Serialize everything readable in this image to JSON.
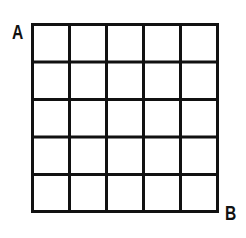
{
  "labels": {
    "start": "A",
    "end": "B"
  },
  "grid": {
    "rows": 5,
    "columns": 5,
    "line_color": "#111111",
    "background": "#ffffff"
  }
}
